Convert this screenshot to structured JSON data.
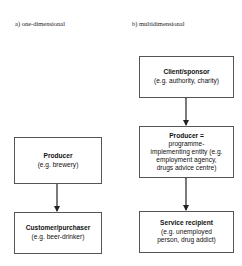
{
  "panels": {
    "a": {
      "label": "a) one-dimensional",
      "boxes": [
        {
          "title": "Producer",
          "lines": [
            "(e.g. brewery)"
          ]
        },
        {
          "title": "Customer/purchaser",
          "lines": [
            "(e.g. beer-drinker)"
          ]
        }
      ],
      "arrows": [
        {
          "from": "Producer",
          "to": "Customer/purchaser",
          "type": "single"
        }
      ]
    },
    "b": {
      "label": "b) multidimensional",
      "boxes": [
        {
          "title": "Client/sponsor",
          "lines": [
            "(e.g. authority, charity)"
          ]
        },
        {
          "title": "Producer =",
          "lines": [
            "programme-",
            "implementing entity (e.g.",
            "employment agency,",
            "drugs advice centre)"
          ]
        },
        {
          "title": "Service recipient",
          "lines": [
            "(e.g. unemployed",
            "person, drug addict)"
          ]
        }
      ],
      "arrows": [
        {
          "from": "Client/sponsor",
          "to": "Producer =",
          "type": "double"
        },
        {
          "from": "Producer =",
          "to": "Service recipient",
          "type": "double"
        }
      ]
    }
  },
  "colors": {
    "border": "#555555",
    "arrow": "#222222",
    "background": "#ffffff"
  }
}
